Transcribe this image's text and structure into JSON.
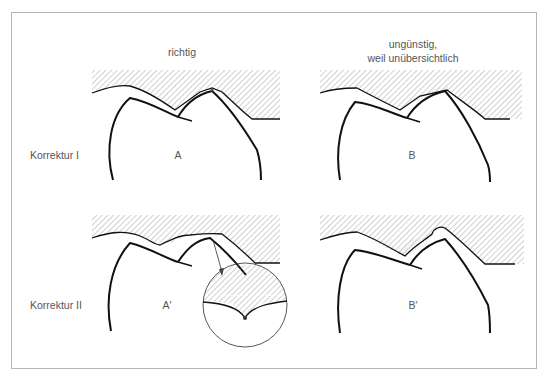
{
  "columns": {
    "left": {
      "heading": "richtig"
    },
    "right": {
      "heading_line1": "ungünstig,",
      "heading_line2": "weil unübersichtlich"
    }
  },
  "rows": {
    "top": {
      "label": "Korrektur I"
    },
    "bottom": {
      "label": "Korrektur II"
    }
  },
  "panels": {
    "A": {
      "label": "A"
    },
    "B": {
      "label": "B"
    },
    "A_prime": {
      "label": "A′"
    },
    "B_prime": {
      "label": "B′"
    }
  },
  "colors": {
    "outline": "#111111",
    "hatch": "#8a8a8a",
    "frame": "#b5b5b5",
    "text": "#555555"
  }
}
